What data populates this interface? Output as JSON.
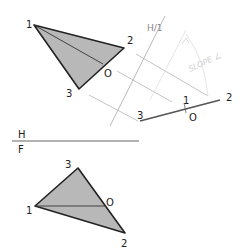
{
  "diagram": {
    "type": "descriptive-geometry",
    "topic": "edge view of plane / slope angle",
    "colors": {
      "triangle_fill": "#b8b8b8",
      "edge": "#222222",
      "construction": "#bdbdbd",
      "handwriting": "#d0d0d0"
    },
    "top_view": {
      "points": {
        "1": "1",
        "2": "2",
        "3": "3",
        "o": "O"
      }
    },
    "fold_line_aux": {
      "label": "H/1"
    },
    "edge_view": {
      "labels": {
        "p3": "3",
        "p1": "1",
        "po": "O",
        "p2": "2"
      }
    },
    "annotation": "SLOPE ∠",
    "fold_line_hf": {
      "top": "H",
      "bottom": "F"
    },
    "front_view": {
      "points": {
        "1": "1",
        "2": "2",
        "3": "3",
        "o": "O"
      }
    }
  }
}
